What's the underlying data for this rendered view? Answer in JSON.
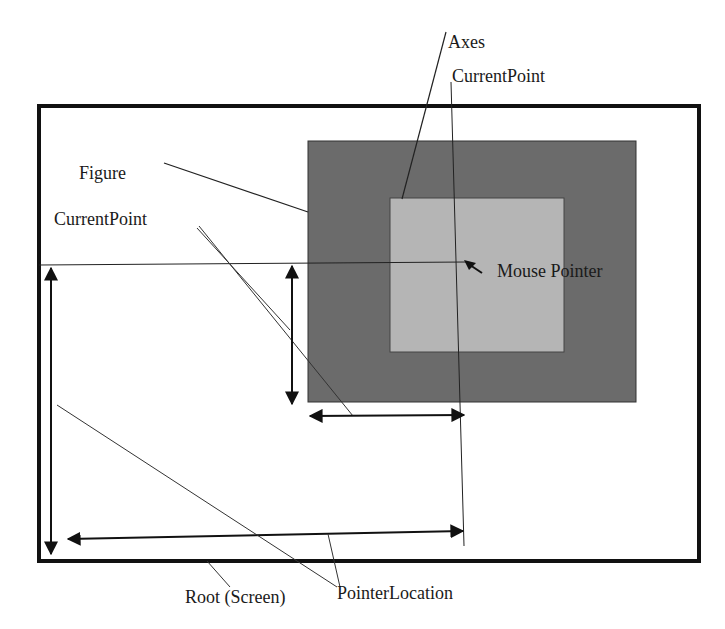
{
  "diagram": {
    "type": "annotated-coordinate-diagram",
    "colors": {
      "background": "#ffffff",
      "screen_border": "#111111",
      "figure_fill": "#6b6b6b",
      "axes_fill": "#b5b5b5",
      "line": "#222222"
    },
    "nodes": [
      {
        "id": "root",
        "label": "Root (Screen)"
      },
      {
        "id": "figure",
        "label": "Figure"
      },
      {
        "id": "axes",
        "label": "Axes"
      },
      {
        "id": "mouse",
        "label": "Mouse Pointer"
      }
    ],
    "labels": {
      "axes": "Axes",
      "axes_current_point": "CurrentPoint",
      "figure": "Figure",
      "figure_current_point": "CurrentPoint",
      "mouse_pointer": "Mouse Pointer",
      "root": "Root (Screen)",
      "pointer_location": "PointerLocation"
    },
    "edges": [
      {
        "from": "axes_current_point",
        "to": "mouse",
        "meaning": "Axes CurrentPoint at pointer"
      },
      {
        "from": "figure_current_point",
        "to": "figure",
        "meaning": "Figure CurrentPoint measured from figure corner"
      },
      {
        "from": "pointer_location",
        "to": "root",
        "meaning": "PointerLocation measured from screen corner"
      }
    ]
  }
}
